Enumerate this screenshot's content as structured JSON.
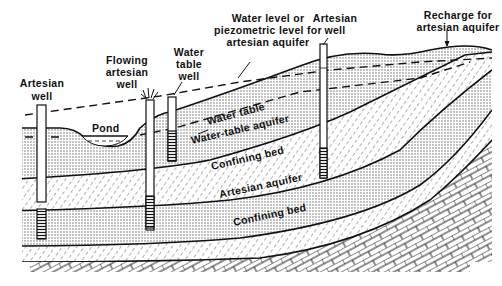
{
  "diagram": {
    "type": "cross-section",
    "colors": {
      "ink": "#111111",
      "background": "#ffffff",
      "dots": "#555555"
    },
    "labels": {
      "artesian_well_left": [
        "Artesian",
        "well"
      ],
      "flowing_artesian_well": [
        "Flowing",
        "artesian",
        "well"
      ],
      "water_table_well": [
        "Water",
        "table",
        "well"
      ],
      "piezometric_level": [
        "Water level or",
        "piezometric level for",
        "artesian aquifer"
      ],
      "artesian_well_right": [
        "Artesian",
        "well"
      ],
      "recharge": [
        "Recharge for",
        "artesian aquifer"
      ],
      "pond": "Pond",
      "water_table": "Water table",
      "water_table_aquifer": "Water-table aquifer",
      "confining_bed_upper": "Confining bed",
      "artesian_aquifer": "Artesian aquifer",
      "confining_bed_lower": "Confining bed"
    },
    "layers": [
      {
        "name": "Water-table aquifer",
        "pattern": "dots"
      },
      {
        "name": "Confining bed",
        "pattern": "hatch"
      },
      {
        "name": "Artesian aquifer",
        "pattern": "dots"
      },
      {
        "name": "Confining bed",
        "pattern": "hatch"
      },
      {
        "name": "Bedrock",
        "pattern": "bricks"
      }
    ],
    "wells": [
      {
        "name": "Artesian well (left)"
      },
      {
        "name": "Flowing artesian well"
      },
      {
        "name": "Water table well"
      },
      {
        "name": "Artesian well (right)"
      }
    ]
  }
}
